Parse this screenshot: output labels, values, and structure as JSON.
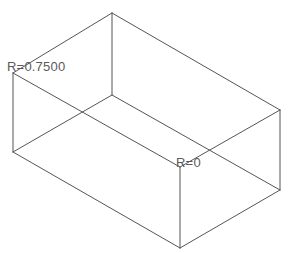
{
  "drawing": {
    "title": "Isometric wireframe box with fillet radius annotations",
    "background_color": "#ffffff",
    "line_color": "#555555",
    "line_width": 1,
    "label_color": "#5a5a5a"
  },
  "annotations": [
    {
      "id": "radius-top-edge",
      "text": "R=0.7500",
      "x": 7,
      "y": 60
    },
    {
      "id": "radius-inner-corner",
      "text": "R=0",
      "x": 176,
      "y": 156
    }
  ],
  "geometry": {
    "type": "isometric-box-wireframe",
    "vertices": {
      "outer_back_apex": [
        112,
        13
      ],
      "outer_left_top": [
        13,
        73
      ],
      "outer_right_top": [
        280,
        110
      ],
      "outer_left_bottom": [
        13,
        152
      ],
      "outer_right_bottom": [
        280,
        190
      ],
      "outer_front_bottom": [
        180,
        248
      ],
      "inner_top_front": [
        112,
        95
      ],
      "inner_front_corner": [
        180,
        167
      ]
    },
    "edges": [
      {
        "name": "top-back-left",
        "from": [
          13,
          73
        ],
        "to": [
          112,
          13
        ]
      },
      {
        "name": "top-back-right",
        "from": [
          112,
          13
        ],
        "to": [
          280,
          110
        ]
      },
      {
        "name": "top-front-left",
        "from": [
          13,
          152
        ],
        "to": [
          180,
          248
        ]
      },
      {
        "name": "top-front-right",
        "from": [
          180,
          248
        ],
        "to": [
          280,
          190
        ]
      },
      {
        "name": "left-vertical",
        "from": [
          13,
          73
        ],
        "to": [
          13,
          152
        ]
      },
      {
        "name": "right-vertical",
        "from": [
          280,
          110
        ],
        "to": [
          280,
          190
        ]
      },
      {
        "name": "front-vertical",
        "from": [
          180,
          167
        ],
        "to": [
          180,
          248
        ]
      },
      {
        "name": "back-inner-vertical",
        "from": [
          112,
          13
        ],
        "to": [
          112,
          95
        ]
      },
      {
        "name": "inner-left-edge",
        "from": [
          13,
          73
        ],
        "to": [
          180,
          167
        ]
      },
      {
        "name": "inner-rear-left",
        "from": [
          13,
          152
        ],
        "to": [
          112,
          95
        ]
      },
      {
        "name": "inner-rear-right",
        "from": [
          112,
          95
        ],
        "to": [
          280,
          190
        ]
      },
      {
        "name": "inner-right-edge",
        "from": [
          180,
          167
        ],
        "to": [
          280,
          110
        ]
      }
    ]
  }
}
